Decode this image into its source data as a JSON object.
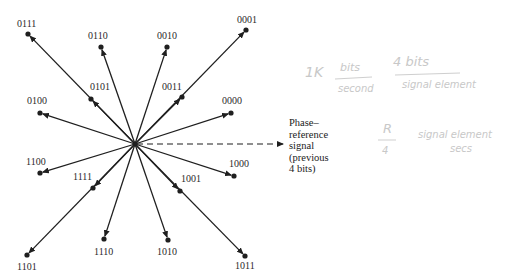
{
  "figure": {
    "center": {
      "x": 135,
      "y": 144
    },
    "points": [
      {
        "code": "0111",
        "x": 28,
        "y": 34,
        "lx": 17,
        "ly": 27,
        "mid": false
      },
      {
        "code": "0110",
        "x": 101,
        "y": 47,
        "lx": 88,
        "ly": 39,
        "mid": false
      },
      {
        "code": "0010",
        "x": 167,
        "y": 47,
        "lx": 157,
        "ly": 39,
        "mid": false
      },
      {
        "code": "0001",
        "x": 246,
        "y": 30,
        "lx": 237,
        "ly": 23,
        "mid": false
      },
      {
        "code": "0101",
        "x": 91,
        "y": 99,
        "lx": 90,
        "ly": 90,
        "mid": true
      },
      {
        "code": "0011",
        "x": 182,
        "y": 97,
        "lx": 162,
        "ly": 90,
        "mid": true
      },
      {
        "code": "0100",
        "x": 40,
        "y": 113,
        "lx": 27,
        "ly": 104,
        "mid": false
      },
      {
        "code": "0000",
        "x": 231,
        "y": 113,
        "lx": 222,
        "ly": 104,
        "mid": false
      },
      {
        "code": "1100",
        "x": 40,
        "y": 173,
        "lx": 26,
        "ly": 165,
        "mid": false
      },
      {
        "code": "1000",
        "x": 234,
        "y": 176,
        "lx": 229,
        "ly": 167,
        "mid": false
      },
      {
        "code": "1111",
        "x": 93,
        "y": 188,
        "lx": 73,
        "ly": 180,
        "mid": true
      },
      {
        "code": "1001",
        "x": 180,
        "y": 191,
        "lx": 181,
        "ly": 182,
        "mid": true
      },
      {
        "code": "1110",
        "x": 104,
        "y": 239,
        "lx": 94,
        "ly": 255,
        "mid": false
      },
      {
        "code": "1010",
        "x": 168,
        "y": 240,
        "lx": 157,
        "ly": 255,
        "mid": false
      },
      {
        "code": "1101",
        "x": 27,
        "y": 255,
        "lx": 17,
        "ly": 270,
        "mid": false
      },
      {
        "code": "1011",
        "x": 245,
        "y": 256,
        "lx": 235,
        "ly": 269,
        "mid": false
      }
    ],
    "reference_arrow": {
      "x1": 137,
      "y1": 144,
      "x2": 283,
      "y2": 144
    },
    "reference_label": [
      "Phase–",
      "reference",
      "signal",
      "(previous",
      "4 bits)"
    ],
    "handwritten_notes": [
      "1K",
      "bits",
      "second",
      "4 bits",
      "signal element",
      "R",
      "4",
      "signal element",
      "secs"
    ]
  },
  "colors": {
    "ink": "#1f1f1f",
    "pencil": "#c8c8c8"
  }
}
